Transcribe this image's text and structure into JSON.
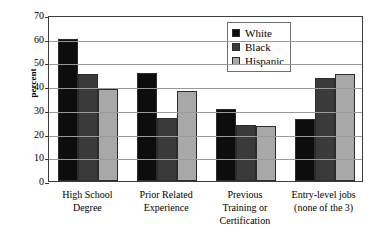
{
  "chart_data": {
    "type": "bar",
    "title": "",
    "xlabel": "",
    "ylabel": "percent",
    "ylim": [
      0,
      70
    ],
    "yticks": [
      0,
      10,
      20,
      30,
      40,
      50,
      60,
      70
    ],
    "ytick_labels": [
      "0",
      "10",
      "20",
      "30",
      "40",
      "50",
      "60",
      "70"
    ],
    "grid": true,
    "legend_position": "upper right inside plot",
    "categories": [
      "High School Degree",
      "Prior Related Experience",
      "Previous Training or Certification",
      "Entry-level jobs (none of the 3)"
    ],
    "category_lines": [
      [
        "High School",
        "Degree"
      ],
      [
        "Prior Related",
        "Experience"
      ],
      [
        "Previous",
        "Training or",
        "Certification"
      ],
      [
        "Entry-level jobs",
        "(none of the 3)"
      ]
    ],
    "series": [
      {
        "name": "White",
        "color": "#0d0d0d",
        "values": [
          60,
          45.5,
          30.5,
          26
        ]
      },
      {
        "name": "Black",
        "color": "#3a3a3a",
        "values": [
          45,
          26.5,
          23.5,
          43.5
        ]
      },
      {
        "name": "Hispanic",
        "color": "#a8a8a8",
        "values": [
          39,
          38,
          23,
          45
        ]
      }
    ]
  },
  "legend": {
    "items": [
      {
        "label": "White",
        "color": "#0d0d0d"
      },
      {
        "label": "Black",
        "color": "#3a3a3a"
      },
      {
        "label": "Hispanic",
        "color": "#a8a8a8"
      }
    ]
  },
  "colors": {
    "axis": "#3c3c3c",
    "gridline": "#9a9a9a",
    "background": "#ffffff",
    "bar_outline": "#2c2c2c"
  }
}
